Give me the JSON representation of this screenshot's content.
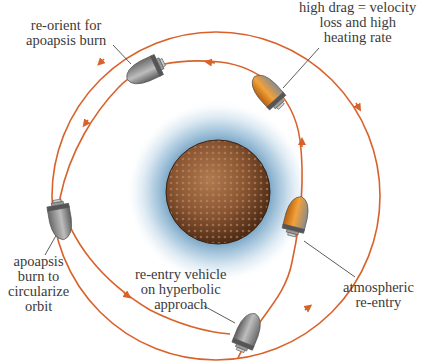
{
  "diagram": {
    "colors": {
      "orbit": "#d9622b",
      "planet": "#7a4a2a",
      "atmosphere": "#8fb8d4",
      "capsule": "#8a8a8a",
      "heated": "#e8901e",
      "leader": "#4a4a4a",
      "text": "#3a3a3a"
    },
    "nodes": [
      {
        "id": "planet",
        "label": "planet",
        "shape": "sphere"
      },
      {
        "id": "atmosphere",
        "label": "atmosphere",
        "shape": "halo"
      },
      {
        "id": "outer-orbit",
        "label": "final circular orbit",
        "shape": "circle"
      },
      {
        "id": "inner-path",
        "label": "aerocapture trajectory",
        "shape": "path"
      }
    ],
    "labels": {
      "reorient": [
        "re-orient for",
        "apoapsis burn"
      ],
      "high_drag": [
        "high drag = velocity",
        "loss and high",
        "heating rate"
      ],
      "apoapsis_burn": [
        "apoapsis",
        "burn to",
        "circularize",
        "orbit"
      ],
      "hyperbolic": [
        "re-entry vehicle",
        "on hyperbolic",
        "approach"
      ],
      "atmospheric": [
        "atmospheric",
        "re-entry"
      ]
    },
    "capsules": [
      {
        "id": "capsule-hyperbolic",
        "state": "approach"
      },
      {
        "id": "capsule-atmospheric-reentry",
        "state": "heating"
      },
      {
        "id": "capsule-high-drag",
        "state": "heating"
      },
      {
        "id": "capsule-reorient",
        "state": "coasting"
      },
      {
        "id": "capsule-apoapsis-burn",
        "state": "burn"
      }
    ]
  }
}
